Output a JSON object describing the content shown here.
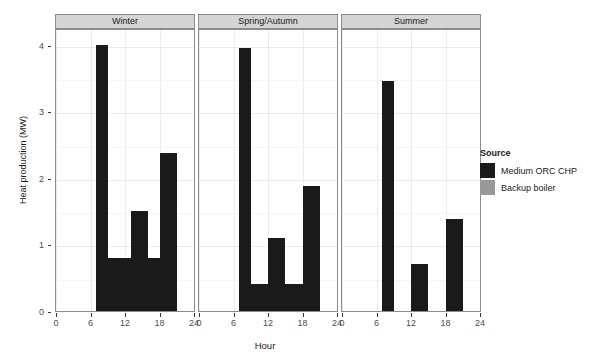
{
  "chart_data": {
    "type": "bar",
    "title": "",
    "xlabel": "Hour",
    "ylabel": "Heat production (MW)",
    "xlim": [
      0,
      24
    ],
    "ylim": [
      0,
      4.25
    ],
    "xticks": [
      0,
      6,
      12,
      18,
      24
    ],
    "yticks": [
      0,
      1,
      2,
      3,
      4
    ],
    "grid": true,
    "legend_position": "right",
    "facets": [
      "Winter",
      "Spring/Autumn",
      "Summer"
    ],
    "series": [
      {
        "name": "Medium ORC CHP",
        "color": "#1a1a1a"
      },
      {
        "name": "Backup boiler",
        "color": "#999999"
      }
    ],
    "panels": [
      {
        "facet": "Winter",
        "bars": [
          {
            "source": "Medium ORC CHP",
            "x0": 7,
            "x1": 9,
            "value": 4.0
          },
          {
            "source": "Medium ORC CHP",
            "x0": 9,
            "x1": 13,
            "value": 0.8
          },
          {
            "source": "Medium ORC CHP",
            "x0": 13,
            "x1": 16,
            "value": 1.5
          },
          {
            "source": "Medium ORC CHP",
            "x0": 16,
            "x1": 18,
            "value": 0.8
          },
          {
            "source": "Medium ORC CHP",
            "x0": 18,
            "x1": 21,
            "value": 2.37
          },
          {
            "source": "Backup boiler",
            "x0": 7,
            "x1": 9,
            "value": 0.45
          }
        ]
      },
      {
        "facet": "Spring/Autumn",
        "bars": [
          {
            "source": "Medium ORC CHP",
            "x0": 7,
            "x1": 9,
            "value": 3.95
          },
          {
            "source": "Medium ORC CHP",
            "x0": 9,
            "x1": 12,
            "value": 0.4
          },
          {
            "source": "Medium ORC CHP",
            "x0": 12,
            "x1": 15,
            "value": 1.1
          },
          {
            "source": "Medium ORC CHP",
            "x0": 15,
            "x1": 18,
            "value": 0.4
          },
          {
            "source": "Medium ORC CHP",
            "x0": 18,
            "x1": 21,
            "value": 1.88
          }
        ]
      },
      {
        "facet": "Summer",
        "bars": [
          {
            "source": "Medium ORC CHP",
            "x0": 7,
            "x1": 9,
            "value": 3.45
          },
          {
            "source": "Medium ORC CHP",
            "x0": 12,
            "x1": 15,
            "value": 0.7
          },
          {
            "source": "Medium ORC CHP",
            "x0": 18,
            "x1": 21,
            "value": 1.38
          }
        ]
      }
    ]
  },
  "legend": {
    "title": "Source",
    "items": [
      {
        "label": "Medium ORC CHP",
        "color": "#1a1a1a"
      },
      {
        "label": "Backup boiler",
        "color": "#999999"
      }
    ]
  }
}
